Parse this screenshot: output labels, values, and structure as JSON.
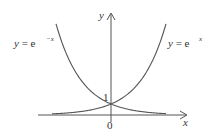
{
  "figure": {
    "axes": {
      "x_label": "x",
      "y_label": "y",
      "origin_label": "0",
      "y_intercept_label": "1"
    },
    "curves": [
      {
        "name": "exp-x",
        "label_prefix": "y = e",
        "label_exp": "x",
        "side": "right"
      },
      {
        "name": "exp-neg-x",
        "label_prefix": "y = e",
        "label_exp": "−x",
        "side": "left"
      }
    ],
    "colors": {
      "line": "#555555",
      "text": "#333333",
      "background": "#ffffff"
    }
  }
}
